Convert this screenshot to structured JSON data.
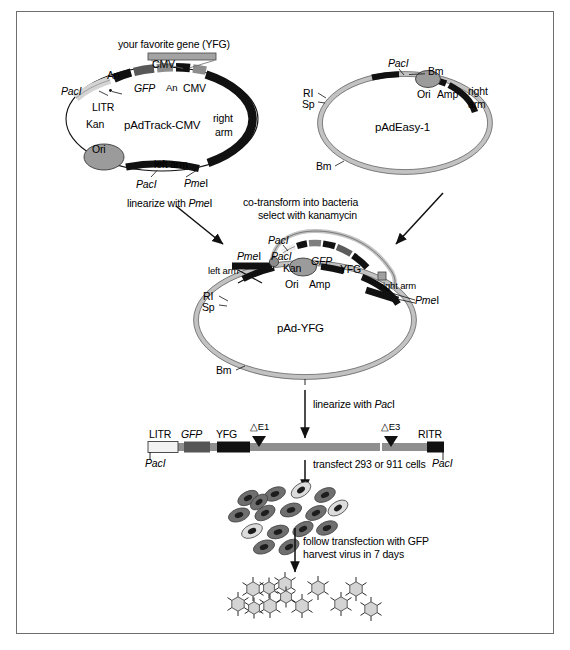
{
  "figure": {
    "background": "#ffffff",
    "border_color": "#6e6e6e"
  },
  "colors": {
    "black_segment": "#111111",
    "dark_gray_segment": "#5a5a5a",
    "mid_gray_segment": "#8c8c8c",
    "light_gray_backbone": "#c9c9c9",
    "white_segment": "#f2f2f2",
    "ori_fill": "#9a9a9a",
    "cell_dark": "#707070",
    "cell_light": "#d8d8d8",
    "virus_fill": "#d0d0d0",
    "linear_backbone": "#8f8f8f",
    "text": "#000000",
    "line": "#111111"
  },
  "panels": {
    "padtrack": {
      "name": "pAdTrack-CMV",
      "plasmid_label": "pAdTrack-CMV",
      "insert_banner": "your favorite gene (YFG)",
      "labels": {
        "pacI_top_left": "PacI",
        "litr": "LITR",
        "kan": "Kan",
        "ori": "Ori",
        "an_left": "An",
        "gfp": "GFP",
        "cmv_left": "CMV",
        "an_right": "An",
        "cmv_right": "CMV",
        "right_arm": "right",
        "right_arm2": "arm",
        "left_arm": "left arm",
        "pmeI": "PmeI",
        "pacI_bottom": "PacI"
      }
    },
    "padeasy": {
      "name": "pAdEasy-1",
      "plasmid_label": "pAdEasy-1",
      "labels": {
        "pacI": "PacI",
        "bm_top": "Bm",
        "ori": "Ori",
        "amp": "Amp",
        "right_arm": "right",
        "right_arm2": "arm",
        "ri": "RI",
        "sp": "Sp",
        "bm_bottom": "Bm"
      }
    },
    "padyfg": {
      "name": "pAd-YFG",
      "plasmid_label": "pAd-YFG",
      "labels": {
        "pacI_top": "PacI",
        "pmeI_left": "PmeI",
        "pacI_left": "PacI",
        "kan": "Kan",
        "gfp": "GFP",
        "yfg": "YFG",
        "left_arm": "left arm",
        "right_arm": "right arm",
        "pmeI_right": "PmeI",
        "ori": "Ori",
        "amp": "Amp",
        "ri": "RI",
        "sp": "Sp",
        "bm": "Bm"
      }
    },
    "linear": {
      "labels": {
        "litr": "LITR",
        "gfp": "GFP",
        "yfg": "YFG",
        "dE1": "△E1",
        "dE3": "△E3",
        "ritr": "RITR",
        "pacI_left": "PacI",
        "pacI_right": "PacI"
      }
    }
  },
  "steps": {
    "linearize_pmeI": "linearize with PmeI",
    "cotransform_line1": "co-transform into bacteria",
    "cotransform_line2": "select with kanamycin",
    "linearize_pacI": "linearize with PacI",
    "transfect": "transfect 293 or 911 cells",
    "follow_line1": "follow transfection with GFP",
    "follow_line2": "harvest virus in 7 days"
  },
  "graphics": {
    "cell_count": 16,
    "virus_count": 12,
    "arrow_color": "#111111"
  }
}
